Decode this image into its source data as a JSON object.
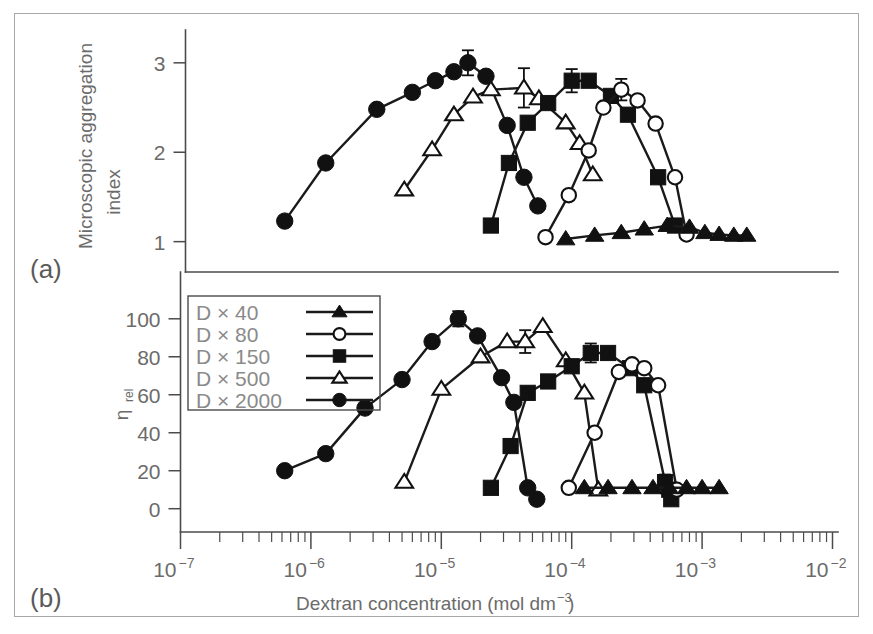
{
  "figure": {
    "panel_a_label": "(a)",
    "panel_b_label": "(b)"
  },
  "legend": {
    "position": "inside-top-left-of-panel-b",
    "entries": [
      {
        "label": "D × 40",
        "marker": "filled-triangle"
      },
      {
        "label": "D × 80",
        "marker": "open-circle"
      },
      {
        "label": "D × 150",
        "marker": "filled-square"
      },
      {
        "label": "D × 500",
        "marker": "open-triangle"
      },
      {
        "label": "D × 2000",
        "marker": "filled-circle"
      }
    ]
  },
  "axes": {
    "x": {
      "label_main": "Dextran concentration (mol dm",
      "label_sup": "−3",
      "label_tail": ")",
      "scale": "log10",
      "min_exp": -7,
      "max_exp": -2,
      "tick_labels": [
        "10",
        "10",
        "10",
        "10",
        "10",
        "10"
      ],
      "tick_exponents": [
        "−7",
        "−6",
        "−5",
        "−4",
        "−3",
        "−2"
      ]
    },
    "y_top": {
      "label_line1": "Microscopic aggregation",
      "label_line2": "index",
      "ticks": [
        1,
        2,
        3
      ],
      "min": 0.75,
      "max": 3.3
    },
    "y_bottom": {
      "label_symbol": "η",
      "label_subscript": "rel",
      "ticks": [
        0,
        20,
        40,
        60,
        80,
        100
      ],
      "min": -7,
      "max": 112
    }
  },
  "chart_data": [
    {
      "type": "line",
      "panel": "a",
      "title": "Microscopic aggregation index vs dextran concentration",
      "xlabel": "Dextran concentration (mol dm-3)",
      "ylabel": "Microscopic aggregation index",
      "xscale": "log10",
      "xlim": [
        1e-07,
        0.01
      ],
      "ylim": [
        0.75,
        3.3
      ],
      "grid": false,
      "legend_position": "panel-b",
      "series": [
        {
          "name": "D × 2000",
          "marker": "filled-circle",
          "points": [
            {
              "x": 6.3e-07,
              "y": 1.23
            },
            {
              "x": 1.3e-06,
              "y": 1.88
            },
            {
              "x": 3.2e-06,
              "y": 2.48
            },
            {
              "x": 6e-06,
              "y": 2.67
            },
            {
              "x": 9e-06,
              "y": 2.8
            },
            {
              "x": 1.25e-05,
              "y": 2.9
            },
            {
              "x": 1.6e-05,
              "y": 3.0,
              "yerr": 0.14
            },
            {
              "x": 2.2e-05,
              "y": 2.85
            },
            {
              "x": 3.2e-05,
              "y": 2.3
            },
            {
              "x": 4.3e-05,
              "y": 1.72
            },
            {
              "x": 5.5e-05,
              "y": 1.4
            }
          ]
        },
        {
          "name": "D × 500",
          "marker": "open-triangle",
          "points": [
            {
              "x": 5.2e-06,
              "y": 1.58
            },
            {
              "x": 8.5e-06,
              "y": 2.03
            },
            {
              "x": 1.25e-05,
              "y": 2.42
            },
            {
              "x": 1.75e-05,
              "y": 2.62
            },
            {
              "x": 2.4e-05,
              "y": 2.7
            },
            {
              "x": 4.3e-05,
              "y": 2.72,
              "yerr": 0.22
            },
            {
              "x": 5.6e-05,
              "y": 2.6
            },
            {
              "x": 9e-05,
              "y": 2.33
            },
            {
              "x": 0.000115,
              "y": 2.1
            },
            {
              "x": 0.000145,
              "y": 1.75
            }
          ]
        },
        {
          "name": "D × 150",
          "marker": "filled-square",
          "points": [
            {
              "x": 2.4e-05,
              "y": 1.18
            },
            {
              "x": 3.3e-05,
              "y": 1.88
            },
            {
              "x": 4.6e-05,
              "y": 2.33
            },
            {
              "x": 6.6e-05,
              "y": 2.55
            },
            {
              "x": 0.0001,
              "y": 2.8,
              "yerr": 0.13
            },
            {
              "x": 0.000135,
              "y": 2.8
            },
            {
              "x": 0.0002,
              "y": 2.63
            },
            {
              "x": 0.00027,
              "y": 2.42
            },
            {
              "x": 0.00046,
              "y": 1.72
            },
            {
              "x": 0.00062,
              "y": 1.18
            }
          ]
        },
        {
          "name": "D × 80",
          "marker": "open-circle",
          "points": [
            {
              "x": 6.3e-05,
              "y": 1.05
            },
            {
              "x": 9.5e-05,
              "y": 1.52
            },
            {
              "x": 0.000135,
              "y": 2.02
            },
            {
              "x": 0.000175,
              "y": 2.5
            },
            {
              "x": 0.00024,
              "y": 2.7,
              "yerr": 0.12
            },
            {
              "x": 0.00032,
              "y": 2.58
            },
            {
              "x": 0.00044,
              "y": 2.32
            },
            {
              "x": 0.00062,
              "y": 1.72
            },
            {
              "x": 0.00076,
              "y": 1.08
            }
          ]
        },
        {
          "name": "D × 40",
          "marker": "filled-triangle",
          "points": [
            {
              "x": 9e-05,
              "y": 1.03
            },
            {
              "x": 0.00015,
              "y": 1.07
            },
            {
              "x": 0.00024,
              "y": 1.1
            },
            {
              "x": 0.00036,
              "y": 1.14
            },
            {
              "x": 0.00054,
              "y": 1.18
            },
            {
              "x": 0.0008,
              "y": 1.16
            },
            {
              "x": 0.00105,
              "y": 1.1
            },
            {
              "x": 0.00135,
              "y": 1.08
            },
            {
              "x": 0.00175,
              "y": 1.07
            },
            {
              "x": 0.0022,
              "y": 1.07
            }
          ]
        }
      ]
    },
    {
      "type": "line",
      "panel": "b",
      "title": "Relative viscosity vs dextran concentration",
      "xlabel": "Dextran concentration (mol dm-3)",
      "ylabel": "eta_rel",
      "xscale": "log10",
      "xlim": [
        1e-07,
        0.01
      ],
      "ylim": [
        -7,
        112
      ],
      "grid": false,
      "legend_position": "inside-top-left",
      "series": [
        {
          "name": "D × 2000",
          "marker": "filled-circle",
          "points": [
            {
              "x": 6.3e-07,
              "y": 20
            },
            {
              "x": 1.3e-06,
              "y": 29
            },
            {
              "x": 2.6e-06,
              "y": 53
            },
            {
              "x": 5e-06,
              "y": 68
            },
            {
              "x": 8.5e-06,
              "y": 88
            },
            {
              "x": 1.35e-05,
              "y": 100,
              "yerr": 4
            },
            {
              "x": 1.9e-05,
              "y": 91
            },
            {
              "x": 2.9e-05,
              "y": 69
            },
            {
              "x": 3.6e-05,
              "y": 56
            },
            {
              "x": 4.6e-05,
              "y": 11
            },
            {
              "x": 5.4e-05,
              "y": 5
            }
          ]
        },
        {
          "name": "D × 500",
          "marker": "open-triangle",
          "points": [
            {
              "x": 5.2e-06,
              "y": 14
            },
            {
              "x": 1e-05,
              "y": 63
            },
            {
              "x": 2e-05,
              "y": 80
            },
            {
              "x": 3.2e-05,
              "y": 88
            },
            {
              "x": 4.4e-05,
              "y": 88,
              "yerr": 6
            },
            {
              "x": 6e-05,
              "y": 96
            },
            {
              "x": 9e-05,
              "y": 78
            },
            {
              "x": 0.000125,
              "y": 61
            },
            {
              "x": 0.00016,
              "y": 10
            }
          ]
        },
        {
          "name": "D × 150",
          "marker": "filled-square",
          "points": [
            {
              "x": 2.4e-05,
              "y": 11
            },
            {
              "x": 3.4e-05,
              "y": 33
            },
            {
              "x": 4.6e-05,
              "y": 61
            },
            {
              "x": 6.6e-05,
              "y": 67
            },
            {
              "x": 0.0001,
              "y": 75
            },
            {
              "x": 0.00014,
              "y": 82,
              "yerr": 5
            },
            {
              "x": 0.00019,
              "y": 82
            },
            {
              "x": 0.00028,
              "y": 74
            },
            {
              "x": 0.00036,
              "y": 65
            },
            {
              "x": 0.00052,
              "y": 14,
              "yerr": 4
            },
            {
              "x": 0.00056,
              "y": 10
            },
            {
              "x": 0.00058,
              "y": 5
            }
          ]
        },
        {
          "name": "D × 80",
          "marker": "open-circle",
          "points": [
            {
              "x": 9.5e-05,
              "y": 11
            },
            {
              "x": 0.00015,
              "y": 40
            },
            {
              "x": 0.00023,
              "y": 72
            },
            {
              "x": 0.00029,
              "y": 76
            },
            {
              "x": 0.00036,
              "y": 74
            },
            {
              "x": 0.00046,
              "y": 65
            },
            {
              "x": 0.00064,
              "y": 10
            }
          ]
        },
        {
          "name": "D × 40",
          "marker": "filled-triangle",
          "points": [
            {
              "x": 0.000125,
              "y": 11
            },
            {
              "x": 0.00019,
              "y": 11
            },
            {
              "x": 0.00029,
              "y": 11
            },
            {
              "x": 0.00042,
              "y": 11
            },
            {
              "x": 0.00056,
              "y": 11
            },
            {
              "x": 0.00076,
              "y": 11
            },
            {
              "x": 0.001,
              "y": 11
            },
            {
              "x": 0.00135,
              "y": 11
            }
          ]
        }
      ]
    }
  ]
}
